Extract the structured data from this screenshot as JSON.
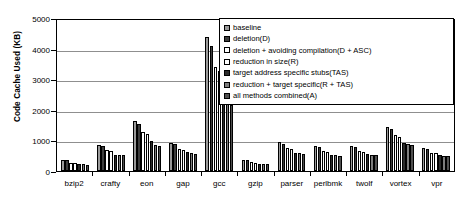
{
  "chart_data": {
    "type": "bar",
    "title": "",
    "xlabel": "",
    "ylabel": "Code Cache Used (KB)",
    "ylim": [
      0,
      5000
    ],
    "ytick_values": [
      0,
      1000,
      2000,
      3000,
      4000,
      5000
    ],
    "ytick_labels": [
      "0",
      "1000",
      "2000",
      "3000",
      "4000",
      "5000"
    ],
    "grid": true,
    "legend_position": "top-right",
    "categories": [
      "bzip2",
      "crafty",
      "eon",
      "gap",
      "gcc",
      "gzip",
      "parser",
      "perlbmk",
      "twolf",
      "vortex",
      "vpr"
    ],
    "series": [
      {
        "name": "baseline",
        "color": "#9a9a9a",
        "values": [
          370,
          860,
          1640,
          930,
          4450,
          370,
          960,
          820,
          830,
          1450,
          760
        ]
      },
      {
        "name": "deletion(D)",
        "color": "#3d3d3d",
        "values": [
          350,
          820,
          1560,
          890,
          4150,
          350,
          900,
          790,
          800,
          1380,
          730
        ]
      },
      {
        "name": "deletion + avoiding compilation(D + ASC)",
        "color": "#ffffff",
        "values": [
          275,
          680,
          1290,
          730,
          3450,
          290,
          760,
          650,
          660,
          1180,
          610
        ]
      },
      {
        "name": "reduction in size(R)",
        "color": "#ffffff",
        "values": [
          265,
          665,
          1240,
          700,
          3300,
          280,
          730,
          625,
          640,
          1130,
          590
        ]
      },
      {
        "name": "target address specific stubs(TAS)",
        "color": "#2b2b2b",
        "values": [
          235,
          540,
          1000,
          620,
          3200,
          240,
          610,
          540,
          560,
          930,
          520
        ]
      },
      {
        "name": "reduction + target specific(R + TAS)",
        "color": "#7d7d7d",
        "values": [
          225,
          525,
          870,
          590,
          2400,
          230,
          580,
          520,
          540,
          890,
          500
        ]
      },
      {
        "name": "all methods combined(A)",
        "color": "#4f4f4f",
        "values": [
          215,
          515,
          840,
          560,
          2200,
          220,
          555,
          500,
          520,
          860,
          490
        ]
      }
    ]
  }
}
